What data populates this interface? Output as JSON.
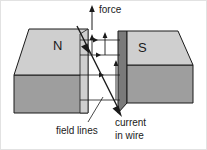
{
  "figure": {
    "poles": {
      "north_label": "N",
      "south_label": "S"
    },
    "annotations": {
      "force_label": "force",
      "field_lines_label": "field lines",
      "current_label_line1": "current",
      "current_label_line2": "in wire"
    },
    "colors": {
      "top_face": "#cfcfcf",
      "front_face": "#9e9e9e",
      "end_face": "#7a7a7a",
      "outline": "#1a1a1a",
      "text": "#1a1a1a",
      "background": "#ffffff",
      "frame": "#e2e2e2"
    },
    "geometry": {
      "field_line_count": 4,
      "field_line_direction": "left-to-right (N to S)",
      "force_direction": "upward",
      "current_direction": "down-right through the gap",
      "force_arrow_count": 3
    }
  }
}
